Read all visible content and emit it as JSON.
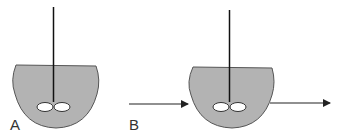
{
  "diagram": {
    "type": "stirred tank reactors",
    "colors": {
      "vessel_fill": "#b3b3b3",
      "stroke": "#222222",
      "impeller_fill": "#ffffff"
    },
    "panels": [
      {
        "label": "A",
        "description": "batch stirred vessel with impeller",
        "inlet": false,
        "outlet": false
      },
      {
        "label": "B",
        "description": "continuous stirred vessel with inlet and outlet arrows",
        "inlet": true,
        "outlet": true
      }
    ]
  }
}
